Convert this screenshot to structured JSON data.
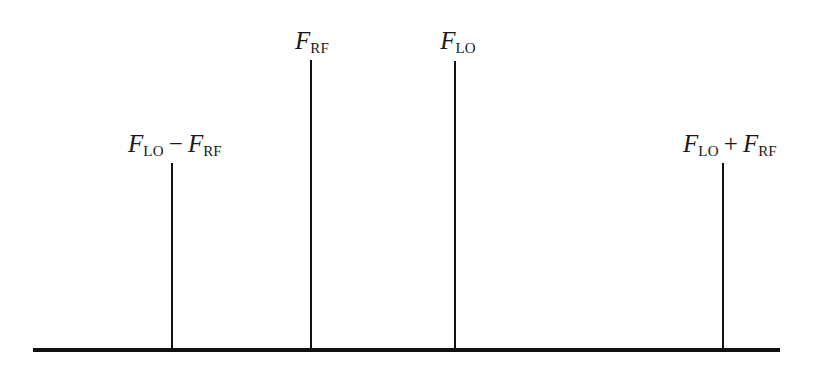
{
  "figure": {
    "background_color": "#ffffff",
    "ink_color": "#111111",
    "width": 816,
    "height": 375,
    "baseline": {
      "x_start": 33,
      "x_end": 780,
      "y": 350,
      "thickness": 4
    }
  },
  "chart_data": {
    "type": "bar",
    "title": "",
    "xlabel": "",
    "ylabel": "",
    "grid": false,
    "legend": null,
    "categories": [
      "F_LO - F_RF",
      "F_RF",
      "F_LO",
      "F_LO + F_RF"
    ],
    "x": [
      172,
      311,
      455,
      723
    ],
    "values": [
      187,
      290,
      289,
      187
    ],
    "ylim": [
      0,
      320
    ],
    "annotations": [
      {
        "id": "difference-product",
        "x": 172,
        "height": 187,
        "top_y": 163,
        "label_parts": {
          "symbol1": "F",
          "subscript1": "LO",
          "operator": "−",
          "symbol2": "F",
          "subscript2": "RF"
        },
        "label_text": "F_LO − F_RF",
        "label_x": 175,
        "label_y": 131
      },
      {
        "id": "rf-carrier",
        "x": 311,
        "height": 290,
        "top_y": 60,
        "label_parts": {
          "symbol1": "F",
          "subscript1": "RF",
          "operator": "",
          "symbol2": "",
          "subscript2": ""
        },
        "label_text": "F_RF",
        "label_x": 312,
        "label_y": 28
      },
      {
        "id": "lo-carrier",
        "x": 455,
        "height": 289,
        "top_y": 61,
        "label_parts": {
          "symbol1": "F",
          "subscript1": "LO",
          "operator": "",
          "symbol2": "",
          "subscript2": ""
        },
        "label_text": "F_LO",
        "label_x": 458,
        "label_y": 28
      },
      {
        "id": "sum-product",
        "x": 723,
        "height": 187,
        "top_y": 163,
        "label_parts": {
          "symbol1": "F",
          "subscript1": "LO",
          "operator": "+",
          "symbol2": "F",
          "subscript2": "RF"
        },
        "label_text": "F_LO + F_RF",
        "label_x": 730,
        "label_y": 131
      }
    ]
  }
}
